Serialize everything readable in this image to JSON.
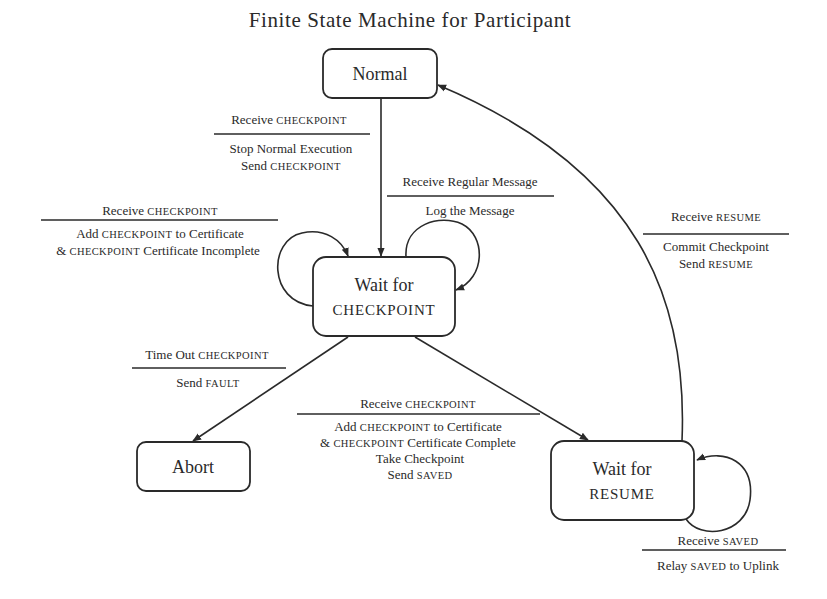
{
  "title": "Finite State Machine for Participant",
  "states": {
    "normal": {
      "label": "Normal"
    },
    "wait_checkpoint": {
      "line1": "Wait for",
      "line2": "CHECKPOINT"
    },
    "abort": {
      "label": "Abort"
    },
    "wait_resume": {
      "line1": "Wait for",
      "line2": "RESUME"
    }
  },
  "transitions": {
    "normal_to_wait_checkpoint": {
      "event_a": "Receive ",
      "event_b": "CHECKPOINT",
      "action1_a": "Stop Normal Execution",
      "action2_a": "Send ",
      "action2_b": "CHECKPOINT"
    },
    "wait_checkpoint_self_left": {
      "event_a": "Receive ",
      "event_b": "CHECKPOINT",
      "action1_a": "Add ",
      "action1_b": "CHECKPOINT",
      "action1_c": " to Certificate",
      "action2_a": "& ",
      "action2_b": "CHECKPOINT",
      "action2_c": " Certificate Incomplete"
    },
    "wait_checkpoint_self_right": {
      "event": "Receive Regular Message",
      "action": "Log the Message"
    },
    "wait_checkpoint_to_abort": {
      "event_a": "Time Out ",
      "event_b": "CHECKPOINT",
      "action_a": "Send ",
      "action_b": "FAULT"
    },
    "wait_checkpoint_to_wait_resume": {
      "event_a": "Receive ",
      "event_b": "CHECKPOINT",
      "action1_a": "Add ",
      "action1_b": "CHECKPOINT",
      "action1_c": " to Certificate",
      "action2_a": "& ",
      "action2_b": "CHECKPOINT",
      "action2_c": " Certificate Complete",
      "action3": "Take Checkpoint",
      "action4_a": "Send ",
      "action4_b": "SAVED"
    },
    "wait_resume_to_normal": {
      "event_a": "Receive ",
      "event_b": "RESUME",
      "action1": "Commit Checkpoint",
      "action2_a": "Send ",
      "action2_b": "RESUME"
    },
    "wait_resume_self": {
      "event_a": "Receive ",
      "event_b": "SAVED",
      "action_a": "Relay ",
      "action_b": "SAVED",
      "action_c": " to Uplink"
    }
  },
  "colors": {
    "ink": "#2a2a2a",
    "background": "#ffffff"
  }
}
